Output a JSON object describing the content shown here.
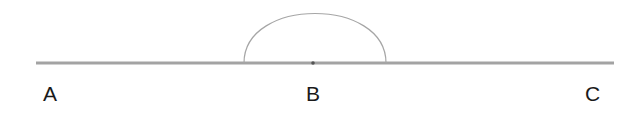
{
  "diagram": {
    "line": {
      "x1": 36,
      "x2": 614,
      "y": 63,
      "color": "#9a9a9a"
    },
    "arc": {
      "x_start": 244,
      "x_end": 386,
      "peak_y": 13,
      "color": "#9a9a9a"
    },
    "center_point": {
      "x": 313,
      "y": 63,
      "color": "#555555"
    },
    "labels": [
      {
        "text": "A",
        "x": 43,
        "y": 83
      },
      {
        "text": "B",
        "x": 306,
        "y": 83
      },
      {
        "text": "C",
        "x": 585,
        "y": 83
      }
    ]
  }
}
